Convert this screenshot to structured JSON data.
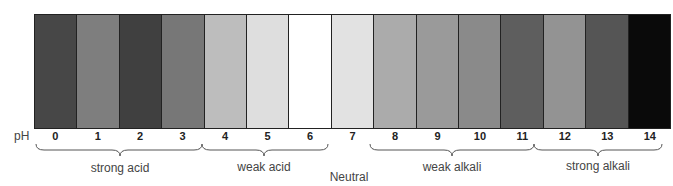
{
  "diagram": {
    "axis_label": "pH",
    "scale": [
      {
        "ph": "0",
        "color": "#474747"
      },
      {
        "ph": "1",
        "color": "#7e7e7e"
      },
      {
        "ph": "2",
        "color": "#404040"
      },
      {
        "ph": "3",
        "color": "#777777"
      },
      {
        "ph": "4",
        "color": "#bdbdbd"
      },
      {
        "ph": "5",
        "color": "#dedede"
      },
      {
        "ph": "6",
        "color": "#ffffff"
      },
      {
        "ph": "7",
        "color": "#e2e2e2"
      },
      {
        "ph": "8",
        "color": "#ababab"
      },
      {
        "ph": "9",
        "color": "#9a9a9a"
      },
      {
        "ph": "10",
        "color": "#8a8a8a"
      },
      {
        "ph": "11",
        "color": "#5e5e5e"
      },
      {
        "ph": "12",
        "color": "#939393"
      },
      {
        "ph": "13",
        "color": "#555555"
      },
      {
        "ph": "14",
        "color": "#0a0a0a"
      }
    ],
    "groups": [
      {
        "label": "strong acid",
        "from": 0,
        "to": 3
      },
      {
        "label": "weak acid",
        "from": 4,
        "to": 6
      },
      {
        "label": "Neutral",
        "from": 7,
        "to": 7
      },
      {
        "label": "weak alkali",
        "from": 8,
        "to": 11
      },
      {
        "label": "strong alkali",
        "from": 12,
        "to": 14
      }
    ]
  }
}
